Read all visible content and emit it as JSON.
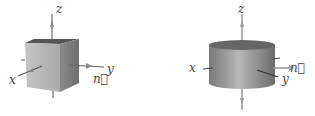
{
  "figures": [
    {
      "shape": "cube",
      "labels": {
        "z": "z",
        "x": "x",
        "y": "y",
        "n": "n⃗"
      }
    },
    {
      "shape": "cylinder",
      "labels": {
        "z": "z",
        "x": "x",
        "y": "y",
        "n": "n⃗"
      }
    }
  ],
  "colors": {
    "face_front": "#b4b4b4",
    "face_side": "#7d7d7d",
    "face_top": "#5a5a5a",
    "arrow": "#8a8a8a",
    "axis": "#555555"
  }
}
